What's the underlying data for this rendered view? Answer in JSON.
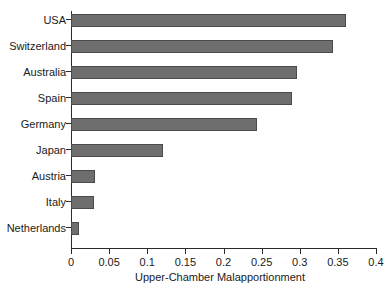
{
  "chart_data": {
    "type": "bar",
    "orientation": "horizontal",
    "title": "",
    "xlabel": "Upper-Chamber Malapportionment",
    "ylabel": "",
    "categories": [
      "USA",
      "Switzerland",
      "Australia",
      "Spain",
      "Germany",
      "Japan",
      "Austria",
      "Italy",
      "Netherlands"
    ],
    "values": [
      0.36,
      0.344,
      0.297,
      0.29,
      0.244,
      0.121,
      0.032,
      0.03,
      0.01
    ],
    "xlim": [
      0,
      0.4
    ],
    "xticks": [
      0,
      0.05,
      0.1,
      0.15,
      0.2,
      0.25,
      0.3,
      0.35,
      0.4
    ],
    "xtick_labels": [
      "0",
      "0.05",
      "0.1",
      "0.15",
      "0.2",
      "0.25",
      "0.3",
      "0.35",
      "0.4"
    ],
    "grid": false,
    "legend": false,
    "bar_color": "#6e6e6e",
    "bar_edge_color": "#4a4a4a",
    "axis_color": "#2b2b2b",
    "background": "#ffffff"
  }
}
